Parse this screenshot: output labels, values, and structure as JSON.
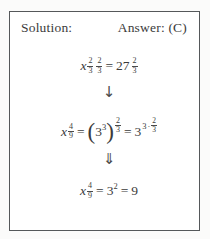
{
  "header": {
    "solution_label": "Solution:",
    "answer_label": "Answer: (C)"
  },
  "colors": {
    "ink": "#3b3b3b",
    "border": "#55585a",
    "background": "#ffffff"
  },
  "equations": {
    "eq1": {
      "lhs_base": "x",
      "exp_frac1": {
        "num": "2",
        "den": "3"
      },
      "exp_frac2": {
        "num": "2",
        "den": "3"
      },
      "equals": "=",
      "rhs_base": "27",
      "rhs_exp": {
        "num": "2",
        "den": "3"
      }
    },
    "arrow1": "↓",
    "eq2": {
      "lhs_base": "x",
      "lhs_exp": {
        "num": "4",
        "den": "9"
      },
      "equals1": "=",
      "paren_open": "(",
      "inner_base": "3",
      "inner_exp": "3",
      "paren_close": ")",
      "outer_exp": {
        "num": "2",
        "den": "3"
      },
      "equals2": "=",
      "rhs_base": "3",
      "rhs_exp_coeff": "3",
      "rhs_exp_dot": "·",
      "rhs_exp_frac": {
        "num": "2",
        "den": "3"
      }
    },
    "arrow2": "⇓",
    "eq3": {
      "lhs_base": "x",
      "lhs_exp": {
        "num": "4",
        "den": "9"
      },
      "equals1": "=",
      "mid_base": "3",
      "mid_exp": "2",
      "equals2": "=",
      "result": "9"
    }
  }
}
